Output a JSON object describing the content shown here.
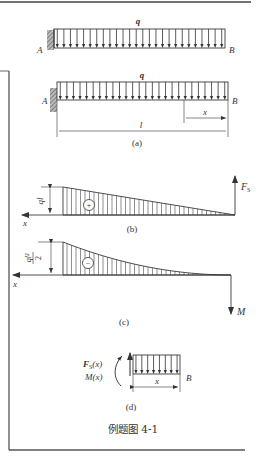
{
  "figure": {
    "caption": "例题图 4-1",
    "colors": {
      "ink": "#3a3a3a",
      "frame": "#555555",
      "background": "#ffffff"
    }
  },
  "panel_a_top": {
    "load_label": "q",
    "left_support_label": "A",
    "right_end_label": "B",
    "support_type": "fixed",
    "arrow_count": 26
  },
  "panel_a": {
    "load_label": "q",
    "left_support_label": "A",
    "right_end_label": "B",
    "dimension_length_label": "l",
    "dimension_x_label": "x",
    "sublabel": "(a)",
    "arrow_count": 26
  },
  "panel_b": {
    "sublabel": "(b)",
    "axis_x_label": "x",
    "axis_y_label": "F",
    "axis_y_subscript": "S",
    "max_value_label": "ql",
    "sign": "+"
  },
  "panel_c": {
    "sublabel": "(c)",
    "axis_x_label": "x",
    "axis_y_label": "M",
    "max_value_numerator": "ql²",
    "max_value_denominator": "2",
    "sign": "−"
  },
  "panel_d": {
    "sublabel": "(d)",
    "shear_label": "F",
    "shear_subscript": "S",
    "shear_arg": "(x)",
    "moment_label": "M(x)",
    "right_end_label": "B",
    "dimension_x_label": "x",
    "arrow_count": 8
  }
}
